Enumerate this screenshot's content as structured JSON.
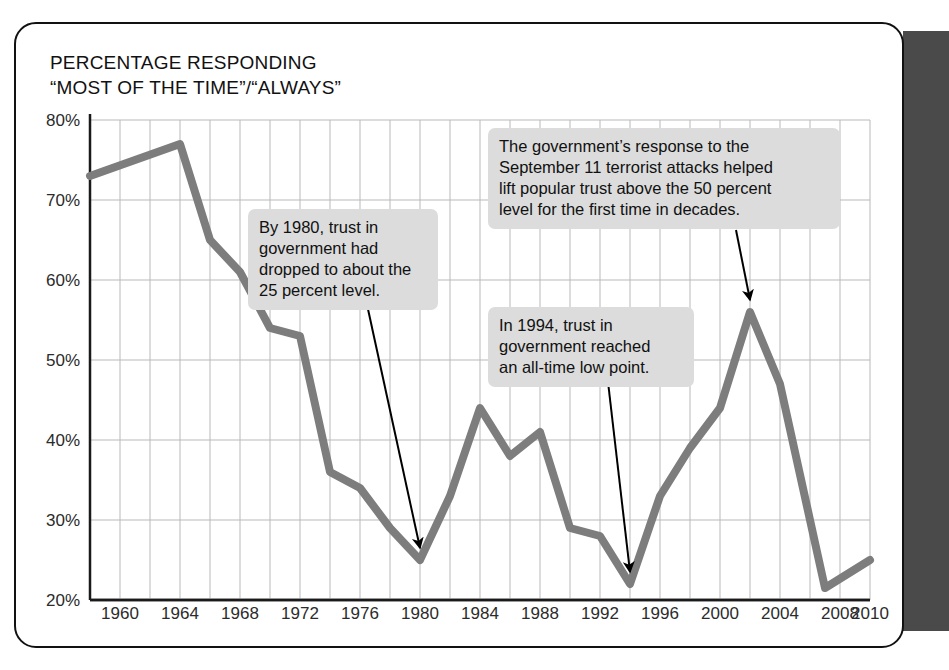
{
  "title": "PERCENTAGE RESPONDING\n“MOST OF THE TIME”/“ALWAYS”",
  "colors": {
    "line": "#7d7d7d",
    "grid": "#b9b9b9",
    "axis": "#1a1a1a",
    "callout_bg": "#dcdcdc",
    "gutter": "#4a4a4a",
    "text": "#111111"
  },
  "annotations": [
    {
      "name": "callout-1980",
      "text": "By 1980, trust in\ngovernment had\ndropped to about the\n25 percent level."
    },
    {
      "name": "callout-911",
      "text": "The government’s response to the\nSeptember 11 terrorist attacks helped\nlift popular trust above the 50 percent\nlevel for the first time in decades."
    },
    {
      "name": "callout-1994",
      "text": "In 1994, trust in\ngovernment reached\nan all-time low point."
    }
  ],
  "chart_data": {
    "type": "line",
    "title": "PERCENTAGE RESPONDING “MOST OF THE TIME”/“ALWAYS”",
    "xlabel": "",
    "ylabel": "",
    "xlim": [
      1958,
      2010
    ],
    "ylim": [
      20,
      80
    ],
    "yticks": [
      20,
      30,
      40,
      50,
      60,
      70,
      80
    ],
    "ytick_labels": [
      "20%",
      "30%",
      "40%",
      "50%",
      "60%",
      "70%",
      "80%"
    ],
    "xticks": [
      1960,
      1964,
      1968,
      1972,
      1976,
      1980,
      1984,
      1988,
      1992,
      1996,
      2000,
      2004,
      2008,
      2010
    ],
    "xtick_labels": [
      "1960",
      "1964",
      "1968",
      "1972",
      "1976",
      "1980",
      "1984",
      "1988",
      "1992",
      "1996",
      "2000",
      "2004",
      "2008",
      "2010"
    ],
    "grid": true,
    "grid_x_step": 2,
    "grid_y_step": 10,
    "legend": "none",
    "series": [
      {
        "name": "Trust in government",
        "x": [
          1958,
          1964,
          1966,
          1968,
          1970,
          1972,
          1974,
          1976,
          1978,
          1980,
          1982,
          1984,
          1986,
          1988,
          1990,
          1992,
          1994,
          1996,
          1998,
          2000,
          2002,
          2004,
          2007,
          2010
        ],
        "values": [
          73,
          77,
          65,
          61,
          54,
          53,
          36,
          34,
          29,
          25,
          33,
          44,
          38,
          41,
          29,
          28,
          22,
          33,
          39,
          44,
          56,
          47,
          21.5,
          25
        ]
      }
    ],
    "callout_points": [
      {
        "label": "By 1980, trust in government had dropped to about the 25 percent level.",
        "x": 1980,
        "y": 25
      },
      {
        "label": "In 1994, trust in government reached an all-time low point.",
        "x": 1994,
        "y": 22
      },
      {
        "label": "The government’s response to the September 11 terrorist attacks helped lift popular trust above the 50 percent level for the first time in decades.",
        "x": 2002,
        "y": 56
      }
    ]
  }
}
